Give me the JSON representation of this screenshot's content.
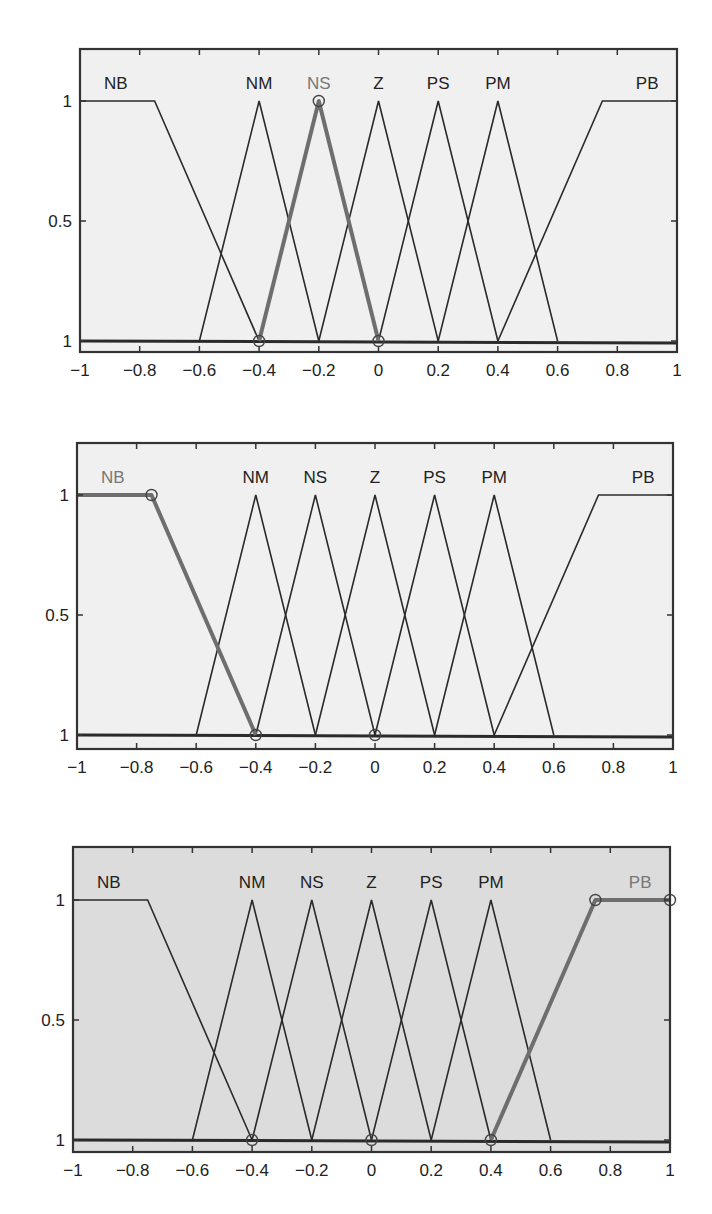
{
  "chart_data": [
    {
      "type": "line",
      "title": "",
      "xlabel": "",
      "ylabel": "",
      "xlim": [
        -1,
        1
      ],
      "ylim": [
        0,
        1.2
      ],
      "xticks": [
        -1,
        -0.8,
        -0.6,
        -0.4,
        -0.2,
        0,
        0.2,
        0.4,
        0.6,
        0.8,
        1
      ],
      "xtick_labels": [
        "−1",
        "−0.8",
        "−0.6",
        "−0.4",
        "−0.2",
        "0",
        "0.2",
        "0.4",
        "0.6",
        "0.8",
        "1"
      ],
      "yticks": [
        0,
        0.5,
        1
      ],
      "ytick_labels": [
        "1",
        "0.5",
        "1"
      ],
      "grid": false,
      "background": "#f0f0f0",
      "highlighted": "NS",
      "highlight_markers": [
        [
          -0.4,
          0
        ],
        [
          -0.2,
          1
        ],
        [
          0,
          0
        ]
      ],
      "series": [
        {
          "name": "NB",
          "x": [
            -1,
            -0.75,
            -0.4
          ],
          "y": [
            1,
            1,
            0
          ]
        },
        {
          "name": "NM",
          "x": [
            -0.6,
            -0.4,
            -0.2
          ],
          "y": [
            0,
            1,
            0
          ]
        },
        {
          "name": "NS",
          "x": [
            -0.4,
            -0.2,
            0
          ],
          "y": [
            0,
            1,
            0
          ]
        },
        {
          "name": "Z",
          "x": [
            -0.2,
            0,
            0.2
          ],
          "y": [
            0,
            1,
            0
          ]
        },
        {
          "name": "PS",
          "x": [
            0,
            0.2,
            0.4
          ],
          "y": [
            0,
            1,
            0
          ]
        },
        {
          "name": "PM",
          "x": [
            0.2,
            0.4,
            0.6
          ],
          "y": [
            0,
            1,
            0
          ]
        },
        {
          "name": "PB",
          "x": [
            0.4,
            0.75,
            1
          ],
          "y": [
            0,
            1,
            1
          ]
        }
      ],
      "labels": [
        {
          "text": "NB",
          "x": -0.88
        },
        {
          "text": "NM",
          "x": -0.4
        },
        {
          "text": "NS",
          "x": -0.2
        },
        {
          "text": "Z",
          "x": 0
        },
        {
          "text": "PS",
          "x": 0.2
        },
        {
          "text": "PM",
          "x": 0.4
        },
        {
          "text": "PB",
          "x": 0.9
        }
      ]
    },
    {
      "type": "line",
      "title": "",
      "xlabel": "",
      "ylabel": "",
      "xlim": [
        -1,
        1
      ],
      "ylim": [
        0,
        1.2
      ],
      "xticks": [
        -1,
        -0.8,
        -0.6,
        -0.4,
        -0.2,
        0,
        0.2,
        0.4,
        0.6,
        0.8,
        1
      ],
      "xtick_labels": [
        "−1",
        "−0.8",
        "−0.6",
        "−0.4",
        "−0.2",
        "0",
        "0.2",
        "0.4",
        "0.6",
        "0.8",
        "1"
      ],
      "yticks": [
        0,
        0.5,
        1
      ],
      "ytick_labels": [
        "1",
        "0.5",
        "1"
      ],
      "grid": false,
      "background": "#f0f0f0",
      "highlighted": "NB",
      "highlight_markers": [
        [
          -0.75,
          1
        ],
        [
          -0.4,
          0
        ],
        [
          0,
          0
        ]
      ],
      "series": [
        {
          "name": "NB",
          "x": [
            -1,
            -0.75,
            -0.4
          ],
          "y": [
            1,
            1,
            0
          ]
        },
        {
          "name": "NM",
          "x": [
            -0.6,
            -0.4,
            -0.2
          ],
          "y": [
            0,
            1,
            0
          ]
        },
        {
          "name": "NS",
          "x": [
            -0.4,
            -0.2,
            0
          ],
          "y": [
            0,
            1,
            0
          ]
        },
        {
          "name": "Z",
          "x": [
            -0.2,
            0,
            0.2
          ],
          "y": [
            0,
            1,
            0
          ]
        },
        {
          "name": "PS",
          "x": [
            0,
            0.2,
            0.4
          ],
          "y": [
            0,
            1,
            0
          ]
        },
        {
          "name": "PM",
          "x": [
            0.2,
            0.4,
            0.6
          ],
          "y": [
            0,
            1,
            0
          ]
        },
        {
          "name": "PB",
          "x": [
            0.4,
            0.75,
            1
          ],
          "y": [
            0,
            1,
            1
          ]
        }
      ],
      "labels": [
        {
          "text": "NB",
          "x": -0.88
        },
        {
          "text": "NM",
          "x": -0.4
        },
        {
          "text": "NS",
          "x": -0.2
        },
        {
          "text": "Z",
          "x": 0
        },
        {
          "text": "PS",
          "x": 0.2
        },
        {
          "text": "PM",
          "x": 0.4
        },
        {
          "text": "PB",
          "x": 0.9
        }
      ]
    },
    {
      "type": "line",
      "title": "",
      "xlabel": "",
      "ylabel": "",
      "xlim": [
        -1,
        1
      ],
      "ylim": [
        0,
        1.2
      ],
      "xticks": [
        -1,
        -0.8,
        -0.6,
        -0.4,
        -0.2,
        0,
        0.2,
        0.4,
        0.6,
        0.8,
        1
      ],
      "xtick_labels": [
        "−1",
        "−0.8",
        "−0.6",
        "−0.4",
        "−0.2",
        "0",
        "0.2",
        "0.4",
        "0.6",
        "0.8",
        "1"
      ],
      "yticks": [
        0,
        0.5,
        1
      ],
      "ytick_labels": [
        "1",
        "0.5",
        "1"
      ],
      "grid": false,
      "background": "#dcdcdc",
      "highlighted": "PB",
      "highlight_markers": [
        [
          -0.4,
          0
        ],
        [
          0,
          0
        ],
        [
          0.4,
          0
        ],
        [
          0.75,
          1
        ],
        [
          1,
          1
        ]
      ],
      "series": [
        {
          "name": "NB",
          "x": [
            -1,
            -0.75,
            -0.4
          ],
          "y": [
            1,
            1,
            0
          ]
        },
        {
          "name": "NM",
          "x": [
            -0.6,
            -0.4,
            -0.2
          ],
          "y": [
            0,
            1,
            0
          ]
        },
        {
          "name": "NS",
          "x": [
            -0.4,
            -0.2,
            0
          ],
          "y": [
            0,
            1,
            0
          ]
        },
        {
          "name": "Z",
          "x": [
            -0.2,
            0,
            0.2
          ],
          "y": [
            0,
            1,
            0
          ]
        },
        {
          "name": "PS",
          "x": [
            0,
            0.2,
            0.4
          ],
          "y": [
            0,
            1,
            0
          ]
        },
        {
          "name": "PM",
          "x": [
            0.2,
            0.4,
            0.6
          ],
          "y": [
            0,
            1,
            0
          ]
        },
        {
          "name": "PB",
          "x": [
            0.4,
            0.75,
            1
          ],
          "y": [
            0,
            1,
            1
          ]
        }
      ],
      "labels": [
        {
          "text": "NB",
          "x": -0.88
        },
        {
          "text": "NM",
          "x": -0.4
        },
        {
          "text": "NS",
          "x": -0.2
        },
        {
          "text": "Z",
          "x": 0
        },
        {
          "text": "PS",
          "x": 0.2
        },
        {
          "text": "PM",
          "x": 0.4
        },
        {
          "text": "PB",
          "x": 0.9
        }
      ]
    }
  ],
  "style": {
    "line_color": "#2a2a2a",
    "highlight_color": "#6e6e6e",
    "frame_color": "#333333"
  },
  "layout": [
    {
      "left": 80,
      "right": 677,
      "top": 49,
      "bottom": 352,
      "y1": 101,
      "y0": 341
    },
    {
      "left": 77,
      "right": 673,
      "top": 443,
      "bottom": 749,
      "y1": 495,
      "y0": 735
    },
    {
      "left": 73,
      "right": 670,
      "top": 847,
      "bottom": 1152,
      "y1": 900,
      "y0": 1140
    }
  ]
}
